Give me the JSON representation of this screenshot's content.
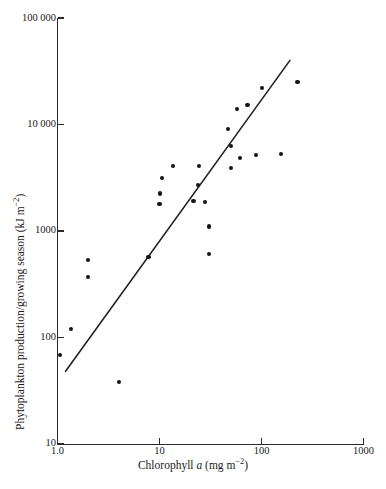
{
  "figure": {
    "title": "",
    "top_caption_sliver": "",
    "bottom_caption_sliver": ""
  },
  "chart_data": {
    "type": "scatter",
    "title": "",
    "xlabel": "Chlorophyll a (mg m−2)",
    "xlabel_parts": {
      "pre": "Chlorophyll ",
      "italic": "a",
      "post": " (mg m",
      "exp": "−2",
      "tail": ")"
    },
    "ylabel": "Phytoplankton production/growing season (kJ m−2)",
    "ylabel_parts": {
      "pre": "Phytoplankton production/growing season (kJ m",
      "exp": "−2",
      "tail": ")"
    },
    "xscale": "log",
    "yscale": "log",
    "xlim": [
      1.0,
      1000
    ],
    "ylim": [
      10,
      100000
    ],
    "grid": false,
    "legend": null,
    "xticks": [
      1.0,
      10,
      100,
      1000
    ],
    "xtick_labels": [
      "1.0",
      "10",
      "100",
      "1000"
    ],
    "yticks": [
      10,
      100,
      1000,
      10000,
      100000
    ],
    "ytick_labels": [
      "10",
      "100",
      "1000",
      "10 000",
      "100 000"
    ],
    "marker": "filled-circle",
    "marker_color": "#141414",
    "points": [
      {
        "x": 1.05,
        "y": 68
      },
      {
        "x": 1.35,
        "y": 120
      },
      {
        "x": 2.0,
        "y": 530
      },
      {
        "x": 2.0,
        "y": 370
      },
      {
        "x": 4.0,
        "y": 38
      },
      {
        "x": 7.8,
        "y": 570
      },
      {
        "x": 10.0,
        "y": 1800
      },
      {
        "x": 10.6,
        "y": 3150
      },
      {
        "x": 10.2,
        "y": 2250
      },
      {
        "x": 13.5,
        "y": 4050
      },
      {
        "x": 21.5,
        "y": 1900
      },
      {
        "x": 24.5,
        "y": 4050
      },
      {
        "x": 24.0,
        "y": 2700
      },
      {
        "x": 28.0,
        "y": 1880
      },
      {
        "x": 30.5,
        "y": 1100
      },
      {
        "x": 30.5,
        "y": 610
      },
      {
        "x": 47.0,
        "y": 9000
      },
      {
        "x": 50.0,
        "y": 3900
      },
      {
        "x": 50.5,
        "y": 6300
      },
      {
        "x": 58.0,
        "y": 14000
      },
      {
        "x": 62.0,
        "y": 4800
      },
      {
        "x": 73.0,
        "y": 15200
      },
      {
        "x": 88.0,
        "y": 5200
      },
      {
        "x": 101.0,
        "y": 22000
      },
      {
        "x": 155.0,
        "y": 5300
      },
      {
        "x": 225.0,
        "y": 25000
      }
    ],
    "trend_line": {
      "style": "solid",
      "color": "#222222",
      "x_start": 1.2,
      "y_start": 48,
      "x_end": 190,
      "y_end": 40000
    }
  }
}
